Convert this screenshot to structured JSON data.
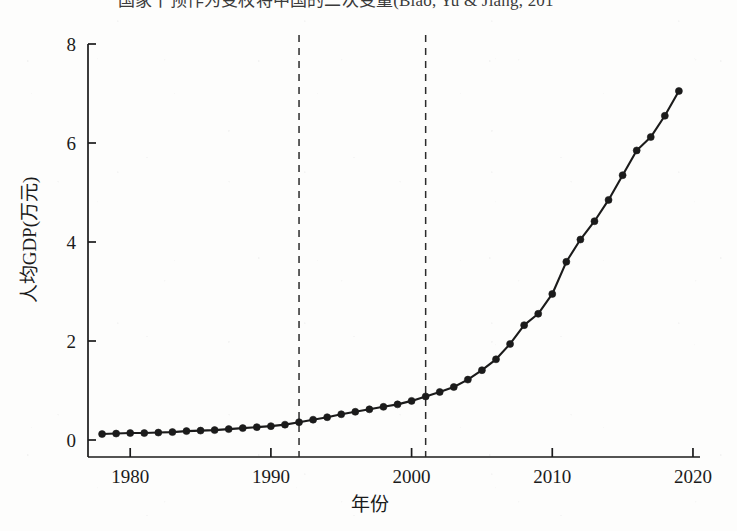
{
  "figure": {
    "clipped_heading_text": "国家干预作为变权将中国的二次变量(Biao, Yu & Jiang, 201",
    "background_color": "#fdfdfc",
    "ink_color": "#1b1b1b"
  },
  "chart_data": {
    "type": "line",
    "title": "",
    "xlabel": "年份",
    "ylabel": "人均GDP(万元)",
    "xlim": [
      1977,
      2020.5
    ],
    "ylim": [
      0,
      8
    ],
    "xticks": [
      1980,
      1990,
      2000,
      2010,
      2020
    ],
    "xticklabels": [
      "1980",
      "1990",
      "2000",
      "2010",
      "2020"
    ],
    "yticks": [
      0,
      2,
      4,
      6,
      8
    ],
    "yticklabels": [
      "0",
      "2",
      "4",
      "6",
      "8"
    ],
    "grid": false,
    "legend": null,
    "marker": "circle",
    "line_color": "#1b1b1b",
    "marker_color": "#1b1b1b",
    "annotations": [
      {
        "type": "vline",
        "x": 1992,
        "style": "dashed",
        "color": "#2b2b2b"
      },
      {
        "type": "vline",
        "x": 2001,
        "style": "dashed",
        "color": "#2b2b2b"
      }
    ],
    "x": [
      1978,
      1979,
      1980,
      1981,
      1982,
      1983,
      1984,
      1985,
      1986,
      1987,
      1988,
      1989,
      1990,
      1991,
      1992,
      1993,
      1994,
      1995,
      1996,
      1997,
      1998,
      1999,
      2000,
      2001,
      2002,
      2003,
      2004,
      2005,
      2006,
      2007,
      2008,
      2009,
      2010,
      2011,
      2012,
      2013,
      2014,
      2015,
      2016,
      2017,
      2018,
      2019
    ],
    "values": [
      0.12,
      0.13,
      0.14,
      0.14,
      0.15,
      0.16,
      0.18,
      0.19,
      0.2,
      0.22,
      0.24,
      0.26,
      0.28,
      0.31,
      0.36,
      0.41,
      0.46,
      0.52,
      0.57,
      0.62,
      0.67,
      0.72,
      0.79,
      0.88,
      0.97,
      1.07,
      1.22,
      1.41,
      1.63,
      1.94,
      2.32,
      2.55,
      2.95,
      3.6,
      4.05,
      4.42,
      4.85,
      5.35,
      5.85,
      6.12,
      6.55,
      7.05
    ],
    "series_name": "人均GDP"
  }
}
